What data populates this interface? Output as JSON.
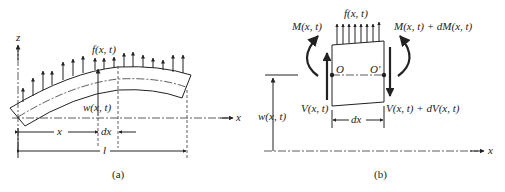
{
  "figure_a": {
    "caption": "(a)",
    "z_axis_label": "z",
    "x_axis_label": "x",
    "load_label": "f(x, t)",
    "deflection_label": "w(x, t)",
    "x_dim_label": "x",
    "dx_dim_label": "dx",
    "length_label": "l"
  },
  "figure_b": {
    "caption": "(b)",
    "load_label": "f(x, t)",
    "moment_left_label": "M(x, t)",
    "moment_right_label": "M(x, t) + dM(x, t)",
    "shear_left_label": "V(x, t)",
    "shear_right_label": "V(x, t) + dV(x, t)",
    "point_left_label": "O",
    "point_right_label": "O'",
    "dx_label": "dx",
    "deflection_label": "w(x, t)",
    "x_axis_label": "x"
  }
}
